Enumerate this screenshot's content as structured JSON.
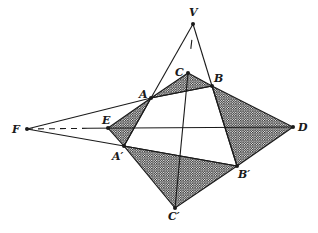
{
  "diagram": {
    "type": "projective-geometry-figure",
    "points": {
      "V": {
        "label": "V",
        "x": 193,
        "y": 24
      },
      "C": {
        "label": "C",
        "x": 188,
        "y": 73
      },
      "B": {
        "label": "B",
        "x": 212,
        "y": 86
      },
      "A": {
        "label": "A",
        "x": 151,
        "y": 98
      },
      "F": {
        "label": "F",
        "x": 27,
        "y": 129
      },
      "E": {
        "label": "E",
        "x": 108,
        "y": 128
      },
      "D": {
        "label": "D",
        "x": 293,
        "y": 127
      },
      "A_prime": {
        "label": "A′",
        "x": 124,
        "y": 146
      },
      "B_prime": {
        "label": "B′",
        "x": 237,
        "y": 166
      },
      "C_prime": {
        "label": "C′",
        "x": 175,
        "y": 208
      }
    },
    "labels": {
      "V": "V",
      "C": "C",
      "B": "B",
      "A": "A",
      "F": "F",
      "E": "E",
      "D": "D",
      "A_prime": "A′",
      "B_prime": "B′",
      "C_prime": "C′"
    },
    "shaded_regions": [
      [
        "A",
        "C",
        "B"
      ],
      [
        "E",
        "A",
        "A_prime"
      ],
      [
        "B",
        "D",
        "B_prime"
      ],
      [
        "A_prime",
        "B_prime",
        "C_prime"
      ]
    ],
    "colors": {
      "line": "#1a1a1a",
      "background": "#ffffff",
      "hatch": "#2a2a2a"
    }
  }
}
